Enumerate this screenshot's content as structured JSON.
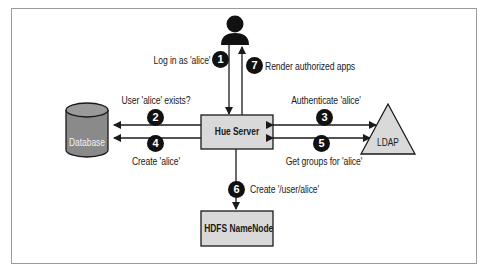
{
  "diagram": {
    "nodes": {
      "user": {
        "label": "",
        "icon": "person-icon"
      },
      "hue_server": {
        "label": "Hue Server"
      },
      "database": {
        "label": "Database",
        "shape": "cylinder"
      },
      "ldap": {
        "label": "LDAP",
        "shape": "triangle"
      },
      "hdfs": {
        "label": "HDFS NameNode"
      }
    },
    "steps": [
      {
        "number": "1",
        "label": "Log in as 'alice'",
        "from": "user",
        "to": "hue_server"
      },
      {
        "number": "2",
        "label": "User 'alice' exists?",
        "from": "hue_server",
        "to": "database"
      },
      {
        "number": "3",
        "label": "Authenticate 'alice'",
        "from": "hue_server",
        "to": "ldap"
      },
      {
        "number": "4",
        "label": "Create 'alice'",
        "from": "hue_server",
        "to": "database"
      },
      {
        "number": "5",
        "label": "Get groups for 'alice'",
        "from": "hue_server",
        "to": "ldap"
      },
      {
        "number": "6",
        "label": "Create '/user/alice'",
        "from": "hue_server",
        "to": "hdfs"
      },
      {
        "number": "7",
        "label": "Render authorized apps",
        "from": "hue_server",
        "to": "user"
      }
    ],
    "colors": {
      "node_fill": "#d9d9d9",
      "database_fill": "#8a8a8a",
      "line": "#1a1a1a",
      "badge": "#111111"
    }
  }
}
